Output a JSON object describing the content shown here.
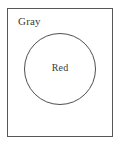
{
  "diagram": {
    "type": "set-containment",
    "background_color": "#ffffff",
    "outer_set": {
      "shape": "rectangle",
      "label": "Gray",
      "label_position": "top-left-inside",
      "stroke_color": "#575757",
      "fill_color": "none",
      "stroke_width": 1,
      "x": 7,
      "y": 8,
      "width": 106,
      "height": 129
    },
    "inner_set": {
      "shape": "circle",
      "label": "Red",
      "label_position": "center",
      "stroke_color": "#4f4f4f",
      "fill_color": "none",
      "stroke_width": 1,
      "center_x": 60,
      "center_y": 69,
      "radius": 36
    },
    "text_color": "#3a3a3a"
  }
}
